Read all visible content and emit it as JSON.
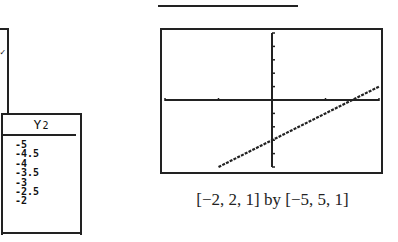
{
  "previous_panel": {
    "mark": "✓"
  },
  "table": {
    "header_main": "Y",
    "header_sub": "2",
    "values": [
      "-5",
      "-4.5",
      "-4",
      "-3.5",
      "-3",
      "-2.5",
      "-2"
    ]
  },
  "graph": {
    "window_caption": "[−2, 2, 1] by [−5, 5, 1]",
    "xmin": -2,
    "xmax": 2,
    "xscl": 1,
    "ymin": -5,
    "ymax": 5,
    "yscl": 1,
    "line_color": "#222222"
  },
  "chart_data": {
    "type": "line",
    "title": "",
    "xlabel": "",
    "ylabel": "",
    "xlim": [
      -2,
      2
    ],
    "ylim": [
      -5,
      5
    ],
    "x_tick_step": 1,
    "y_tick_step": 1,
    "grid": false,
    "series": [
      {
        "name": "Y2",
        "x": [
          -1,
          -0.5,
          0,
          0.5,
          1,
          1.5,
          2
        ],
        "values": [
          -5,
          -4,
          -3,
          -2,
          -1,
          0,
          1
        ]
      }
    ],
    "annotations": [
      "[−2, 2, 1] by [−5, 5, 1]"
    ]
  }
}
